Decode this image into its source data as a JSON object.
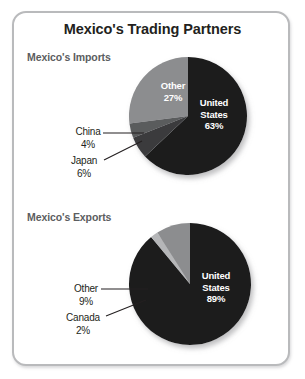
{
  "figure": {
    "title": "Mexico's Trading Partners",
    "frame_color": "#b9babc",
    "background": "#ffffff",
    "title_color": "#231f20",
    "panel_title_color": "#5b5d60"
  },
  "panels": [
    {
      "id": "imports",
      "title": "Mexico's Imports"
    },
    {
      "id": "exports",
      "title": "Mexico's Exports"
    }
  ],
  "labels": {
    "imports_us": "United\nStates\n63%",
    "imports_other": "Other\n27%",
    "imports_china": "China\n4%",
    "imports_japan": "Japan\n6%",
    "exports_us": "United\nStates\n89%",
    "exports_other": "Other\n9%",
    "exports_canada": "Canada\n2%"
  },
  "chart_data": [
    {
      "type": "pie",
      "title": "Mexico's Imports",
      "categories": [
        "United States",
        "Other",
        "China",
        "Japan"
      ],
      "values": [
        63,
        27,
        4,
        6
      ],
      "value_suffix": "%",
      "colors": [
        "#1c1c1c",
        "#8c8d8f",
        "#5a5b5d",
        "#3a3b3d"
      ],
      "labels_inside": [
        "United States 63%",
        "Other 27%"
      ],
      "labels_outside": [
        "China 4%",
        "Japan 6%"
      ],
      "start_angle_deg": 0,
      "direction": "clockwise",
      "legend": "none",
      "grid": false
    },
    {
      "type": "pie",
      "title": "Mexico's Exports",
      "categories": [
        "United States",
        "Other",
        "Canada"
      ],
      "values": [
        89,
        9,
        2
      ],
      "value_suffix": "%",
      "colors": [
        "#1c1c1c",
        "#8c8d8f",
        "#b5b6b8"
      ],
      "labels_inside": [
        "United States 89%"
      ],
      "labels_outside": [
        "Other 9%",
        "Canada 2%"
      ],
      "start_angle_deg": 0,
      "direction": "clockwise",
      "legend": "none",
      "grid": false
    }
  ]
}
